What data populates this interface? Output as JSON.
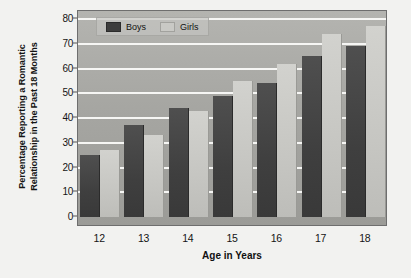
{
  "chart_data": {
    "type": "bar",
    "title": "",
    "xlabel": "Age in Years",
    "ylabel": "Percentage Reporting a Romantic Relationship in the Past 18 Months",
    "ylabel_line1": "Percentage Reporting a Romantic",
    "ylabel_line2": "Relationship in the Past 18 Months",
    "categories": [
      "12",
      "13",
      "14",
      "15",
      "16",
      "17",
      "18"
    ],
    "series": [
      {
        "name": "Boys",
        "color": "#3f3f3f",
        "values": [
          25,
          37,
          44,
          49,
          54,
          65,
          69
        ]
      },
      {
        "name": "Girls",
        "color": "#c6c6c2",
        "values": [
          27,
          33,
          43,
          55,
          62,
          74,
          77
        ]
      }
    ],
    "ylim": [
      0,
      80
    ],
    "yticks": [
      0,
      10,
      20,
      30,
      40,
      50,
      60,
      70,
      80
    ],
    "ytick_labels": [
      "0",
      "10",
      "20",
      "30",
      "40",
      "50",
      "60",
      "70",
      "80"
    ],
    "grid": true,
    "gridline_color": "#f6f6f4",
    "legend_position": "top-left",
    "plot_background": "#a6a6a2",
    "figure_background": "#f2f2f0"
  },
  "legend": {
    "items": [
      {
        "label": "Boys"
      },
      {
        "label": "Girls"
      }
    ]
  }
}
